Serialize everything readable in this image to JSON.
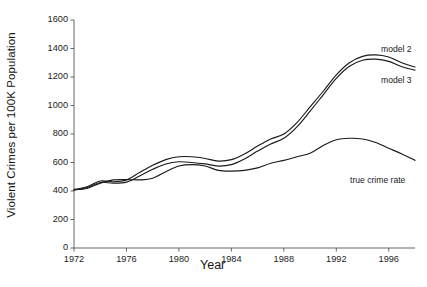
{
  "chart_data": {
    "type": "line",
    "title": "",
    "xlabel": "Year",
    "ylabel": "Violent Crimes per 100K Population",
    "xlim": [
      1972,
      1998
    ],
    "ylim": [
      0,
      1600
    ],
    "xticks": [
      1972,
      1976,
      1980,
      1984,
      1988,
      1992,
      1996
    ],
    "yticks": [
      0,
      200,
      400,
      600,
      800,
      1000,
      1200,
      1400,
      1600
    ],
    "grid": false,
    "legend_position": "inline-right-annotations",
    "line_color": "#1a1a1a",
    "x": [
      1972,
      1973,
      1974,
      1975,
      1976,
      1977,
      1978,
      1979,
      1980,
      1981,
      1982,
      1983,
      1984,
      1985,
      1986,
      1987,
      1988,
      1989,
      1990,
      1991,
      1992,
      1993,
      1994,
      1995,
      1996,
      1997,
      1998
    ],
    "series": [
      {
        "name": "model 2",
        "label": "model 2",
        "values": [
          410,
          430,
          470,
          465,
          478,
          530,
          580,
          620,
          640,
          640,
          628,
          610,
          620,
          660,
          715,
          765,
          800,
          880,
          990,
          1100,
          1215,
          1300,
          1345,
          1355,
          1340,
          1300,
          1270
        ]
      },
      {
        "name": "model 3",
        "label": "model 3",
        "values": [
          405,
          425,
          460,
          455,
          462,
          505,
          552,
          590,
          605,
          600,
          590,
          575,
          585,
          625,
          680,
          730,
          770,
          850,
          960,
          1075,
          1190,
          1275,
          1318,
          1325,
          1310,
          1272,
          1248
        ]
      },
      {
        "name": "true crime rate",
        "label": "true crime rate",
        "values": [
          410,
          418,
          455,
          478,
          480,
          478,
          490,
          535,
          575,
          585,
          575,
          545,
          540,
          545,
          562,
          595,
          615,
          640,
          665,
          720,
          760,
          770,
          765,
          740,
          700,
          660,
          615
        ]
      }
    ],
    "annotations": [
      {
        "text": "model 2",
        "x_px": 381,
        "y_px": 44
      },
      {
        "text": "model 3",
        "x_px": 381,
        "y_px": 75
      },
      {
        "text": "true crime rate",
        "x_px": 350,
        "y_px": 175
      }
    ]
  },
  "axes": {
    "y_tick_labels": [
      "0",
      "200",
      "400",
      "600",
      "800",
      "1000",
      "1200",
      "1400",
      "1600"
    ],
    "x_tick_labels": [
      "1972",
      "1976",
      "1980",
      "1984",
      "1988",
      "1992",
      "1996"
    ],
    "x_title": "Year",
    "y_title": "Violent Crimes per 100K Population"
  }
}
